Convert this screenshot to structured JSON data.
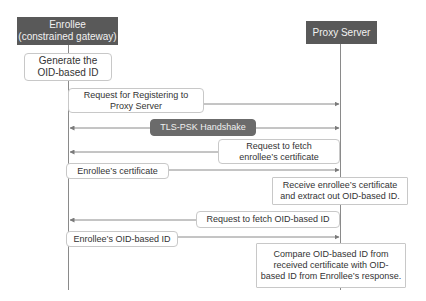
{
  "actors": [
    {
      "id": "enrollee",
      "line1": "Enrollee",
      "line2": "(constrained gateway)"
    },
    {
      "id": "proxy",
      "line1": "Proxy Server"
    }
  ],
  "steps": {
    "generate": {
      "line1": "Generate the",
      "line2": "OID-based ID"
    },
    "register": {
      "line1": "Request for Registering to",
      "line2": "Proxy Server",
      "direction": "enrollee->proxy"
    },
    "tls": {
      "label": "TLS-PSK Handshake",
      "direction": "bidirectional"
    },
    "fetch_cert": {
      "line1": "Request to fetch",
      "line2": "enrollee’s certificate",
      "direction": "proxy->enrollee"
    },
    "cert": {
      "label": "Enrollee’s certificate",
      "direction": "enrollee->proxy"
    },
    "receive": {
      "line1": "Receive enrollee’s certificate",
      "line2": "and extract out OID-based ID."
    },
    "fetch_oid": {
      "label": "Request to fetch OID-based ID",
      "direction": "proxy->enrollee"
    },
    "oid": {
      "label": "Enrollee’s OID-based ID",
      "direction": "enrollee->proxy"
    },
    "compare": {
      "line1": "Compare OID-based ID from",
      "line2": "received certificate with OID-",
      "line3": "based ID from Enrollee’s response."
    }
  },
  "colors": {
    "actor_bg": "#595959",
    "tls_bg": "#6b6b6b",
    "line": "#8a8a8a",
    "box_border": "#c8c8c8"
  }
}
